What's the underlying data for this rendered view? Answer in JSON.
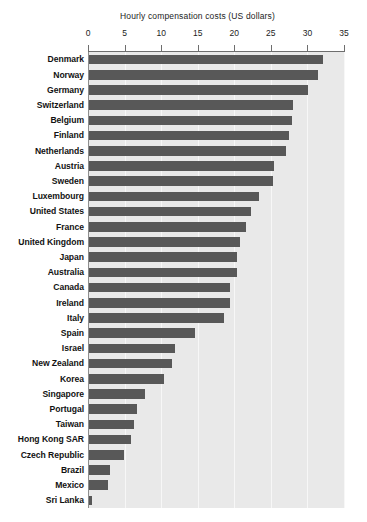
{
  "chart_data": {
    "type": "bar",
    "orientation": "horizontal",
    "title": "Hourly compensation costs (US dollars)",
    "title_position": "top",
    "xlabel": "",
    "ylabel": "",
    "xlim": [
      0,
      35
    ],
    "xticks": [
      0,
      5,
      10,
      15,
      20,
      25,
      30,
      35
    ],
    "xtick_labels": [
      "0",
      "5",
      "10",
      "15",
      "20",
      "25",
      "30",
      "35"
    ],
    "axis_position": "top",
    "grid": true,
    "grid_axis": "x",
    "legend": false,
    "legend_position": "none",
    "bar_color": "#585858",
    "plot_background": "#e9e9e9",
    "gridline_color": "#f7f7f7",
    "axis_color": "#6e6e6e",
    "categories": [
      "Denmark",
      "Norway",
      "Germany",
      "Switzerland",
      "Belgium",
      "Finland",
      "Netherlands",
      "Austria",
      "Sweden",
      "Luxembourg",
      "United States",
      "France",
      "United Kingdom",
      "Japan",
      "Australia",
      "Canada",
      "Ireland",
      "Italy",
      "Spain",
      "Israel",
      "New Zealand",
      "Korea",
      "Singapore",
      "Portugal",
      "Taiwan",
      "Hong Kong SAR",
      "Czech Republic",
      "Brazil",
      "Mexico",
      "Sri Lanka"
    ],
    "values": [
      32.0,
      31.3,
      30.0,
      27.9,
      27.8,
      27.3,
      27.0,
      25.3,
      25.2,
      23.3,
      22.1,
      21.4,
      20.7,
      20.3,
      20.3,
      19.3,
      19.3,
      18.4,
      14.5,
      11.8,
      11.3,
      10.3,
      7.6,
      6.5,
      6.1,
      5.7,
      4.8,
      2.9,
      2.6,
      0.4
    ]
  }
}
